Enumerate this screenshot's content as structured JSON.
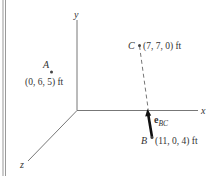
{
  "diagram": {
    "type": "3d-coordinate-vector-diagram",
    "axes": {
      "x": {
        "label": "x"
      },
      "y": {
        "label": "y"
      },
      "z": {
        "label": "z"
      }
    },
    "points": [
      {
        "name": "A",
        "coords": "(0, 6, 5) ft"
      },
      {
        "name": "C",
        "coords": "(7, 7, 0) ft"
      },
      {
        "name": "B",
        "coords": "(11, 0, 4) ft"
      }
    ],
    "vector": {
      "label_main": "e",
      "label_sub": "BC",
      "from": "B",
      "toward": "C"
    },
    "colors": {
      "axis": "#777777",
      "ink": "#222222",
      "border": "#888888"
    }
  }
}
